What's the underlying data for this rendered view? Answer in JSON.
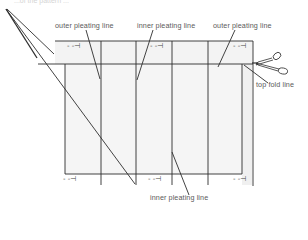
{
  "diagram": {
    "header_text_cutoff": "...of the pattern ...",
    "labels": {
      "outer_pleating_left": "outer pleating line",
      "inner_pleating_top": "inner pleating line",
      "outer_pleating_right": "outer pleating line",
      "top_fold": "top fold line",
      "inner_pleating_bottom": "inner pleating line"
    },
    "marks": {
      "symbol": "- -⊣",
      "top": [
        "- -⊣",
        "- -⊣",
        "- -⊣"
      ],
      "bottom": [
        "- -⊣",
        "- -⊣",
        "- -⊣"
      ]
    },
    "icons": [
      "scissors-icon"
    ],
    "colors": {
      "line": "#2a2a2a",
      "panel_fill": "#f4f4f4",
      "text": "#5a5a5a"
    }
  }
}
